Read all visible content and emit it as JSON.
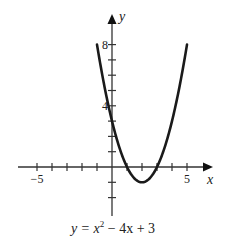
{
  "chart_data": {
    "type": "line",
    "title": "",
    "equation": "y = x^2 - 4x + 3",
    "caption": {
      "prefix": "y = ",
      "var": "x",
      "exp": "2",
      "rest": " − 4x + 3"
    },
    "xlabel": "x",
    "ylabel": "y",
    "xlim": [
      -6,
      6.5
    ],
    "ylim": [
      -3,
      9.5
    ],
    "x_tick_labels": [
      {
        "value": -5,
        "label": "−5"
      },
      {
        "value": 5,
        "label": "5"
      }
    ],
    "y_tick_labels": [
      {
        "value": 4,
        "label": "4"
      },
      {
        "value": 8,
        "label": "8"
      }
    ],
    "x_ticks": [
      -5,
      -4,
      -3,
      -2,
      -1,
      1,
      2,
      3,
      4,
      5
    ],
    "y_ticks": [
      -2,
      -1,
      1,
      2,
      3,
      4,
      5,
      6,
      7,
      8
    ],
    "grid": false,
    "series": [
      {
        "name": "y = x^2 - 4x + 3",
        "x": [
          -1,
          -0.5,
          0,
          0.5,
          1,
          1.5,
          2,
          2.5,
          3,
          3.5,
          4,
          4.5,
          5
        ],
        "y": [
          8,
          5.25,
          3,
          1.25,
          0,
          -0.75,
          -1,
          -0.75,
          0,
          1.25,
          3,
          5.25,
          8
        ]
      }
    ],
    "key_points": {
      "vertex": [
        2,
        -1
      ],
      "x_intercepts": [
        1,
        3
      ],
      "y_intercept": 3
    }
  }
}
